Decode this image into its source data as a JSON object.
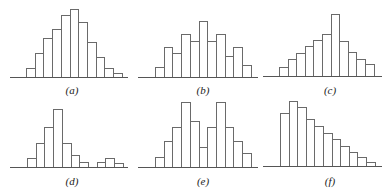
{
  "chart_data": [
    {
      "type": "bar",
      "title": "(a)",
      "description": "Histogram, unimodal, slightly right-skewed",
      "categories": [
        1,
        2,
        3,
        4,
        5,
        6,
        7,
        8,
        9,
        10,
        11
      ],
      "values": [
        9,
        24,
        39,
        48,
        62,
        68,
        55,
        35,
        20,
        9,
        4
      ],
      "xlabel": "",
      "ylabel": "",
      "grid": false,
      "layout": {
        "x0": 26,
        "barWidth": 8.7,
        "baselineY": 77,
        "axisX0": 10,
        "axisX1": 128,
        "labelX": 72,
        "labelY": 84
      }
    },
    {
      "type": "bar",
      "title": "(b)",
      "description": "Histogram, roughly symmetric, multimodal/jagged",
      "categories": [
        1,
        2,
        3,
        4,
        5,
        6,
        7,
        8,
        9,
        10,
        11
      ],
      "values": [
        10,
        30,
        24,
        43,
        36,
        56,
        36,
        43,
        21,
        30,
        12
      ],
      "xlabel": "",
      "ylabel": "",
      "grid": false,
      "layout": {
        "x0": 155,
        "barWidth": 8.7,
        "baselineY": 77,
        "axisX0": 138,
        "axisX1": 258,
        "labelX": 203,
        "labelY": 84
      }
    },
    {
      "type": "bar",
      "title": "(c)",
      "description": "Histogram, left-skewed with tall peak",
      "categories": [
        1,
        2,
        3,
        4,
        5,
        6,
        7,
        8,
        9,
        10,
        11
      ],
      "values": [
        9,
        17,
        23,
        30,
        36,
        42,
        62,
        35,
        24,
        17,
        12
      ],
      "xlabel": "",
      "ylabel": "",
      "grid": false,
      "layout": {
        "x0": 279,
        "barWidth": 8.6,
        "baselineY": 76,
        "axisX0": 263,
        "axisX1": 382,
        "labelX": 330,
        "labelY": 84
      }
    },
    {
      "type": "bar",
      "title": "(d)",
      "description": "Histogram, right-skewed with gap and small secondary cluster",
      "categories": [
        1,
        2,
        3,
        4,
        5,
        6,
        7,
        8,
        9,
        10,
        11
      ],
      "values": [
        9,
        24,
        40,
        58,
        24,
        12,
        5,
        0,
        5,
        9,
        4
      ],
      "xlabel": "",
      "ylabel": "",
      "grid": false,
      "layout": {
        "x0": 27,
        "barWidth": 8.7,
        "baselineY": 167,
        "axisX0": 10,
        "axisX1": 128,
        "labelX": 72,
        "labelY": 175
      }
    },
    {
      "type": "bar",
      "title": "(e)",
      "description": "Histogram, bimodal",
      "categories": [
        1,
        2,
        3,
        4,
        5,
        6,
        7,
        8,
        9,
        10,
        11
      ],
      "values": [
        10,
        26,
        40,
        65,
        46,
        20,
        40,
        65,
        40,
        26,
        14
      ],
      "xlabel": "",
      "ylabel": "",
      "grid": false,
      "layout": {
        "x0": 155,
        "barWidth": 8.7,
        "baselineY": 167,
        "axisX0": 138,
        "axisX1": 258,
        "labelX": 203,
        "labelY": 175
      }
    },
    {
      "type": "bar",
      "title": "(f)",
      "description": "Histogram, strongly right-skewed",
      "categories": [
        1,
        2,
        3,
        4,
        5,
        6,
        7,
        8,
        9,
        10,
        11
      ],
      "values": [
        53,
        65,
        59,
        47,
        40,
        33,
        27,
        20,
        14,
        9,
        4
      ],
      "xlabel": "",
      "ylabel": "",
      "grid": false,
      "layout": {
        "x0": 280,
        "barWidth": 8.6,
        "baselineY": 166,
        "axisX0": 263,
        "axisX1": 382,
        "labelX": 330,
        "labelY": 175
      }
    }
  ],
  "panels": [
    {
      "label": "(a)"
    },
    {
      "label": "(b)"
    },
    {
      "label": "(c)"
    },
    {
      "label": "(d)"
    },
    {
      "label": "(e)"
    },
    {
      "label": "(f)"
    }
  ],
  "colors": {
    "bar_stroke": "#6a6a6a",
    "bar_fill": "#ffffff",
    "axis": "#555555",
    "label": "#222222"
  }
}
